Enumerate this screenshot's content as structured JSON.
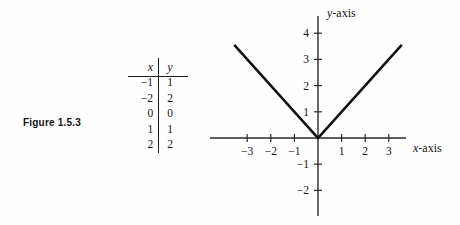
{
  "figure": {
    "caption": "Figure 1.5.3"
  },
  "table": {
    "headers": {
      "x": "x",
      "y": "y"
    },
    "rows": [
      {
        "x": "−1",
        "y": "1"
      },
      {
        "x": "−2",
        "y": "2"
      },
      {
        "x": "0",
        "y": "0"
      },
      {
        "x": "1",
        "y": "1"
      },
      {
        "x": "2",
        "y": "2"
      }
    ]
  },
  "chart_data": {
    "type": "line",
    "title": "",
    "xlabel": "x-axis",
    "ylabel": "y-axis",
    "xlabel_italic_prefix": "x",
    "xlabel_suffix": "-axis",
    "ylabel_italic_prefix": "y",
    "ylabel_suffix": "-axis",
    "xlim": [
      -3.8,
      3.75
    ],
    "ylim": [
      -2.95,
      4.4
    ],
    "xticks": [
      -3,
      -2,
      -1,
      1,
      2,
      3
    ],
    "xticklabels": [
      "−3",
      "−2",
      "−1",
      "1",
      "2",
      "3"
    ],
    "yticks": [
      4,
      3,
      2,
      1,
      -1,
      -2
    ],
    "yticklabels": [
      "4",
      "3",
      "2",
      "1",
      "−1",
      "−2"
    ],
    "grid": false,
    "legend": null,
    "series": [
      {
        "name": "y = |x|",
        "x": [
          -3.55,
          0,
          3.55
        ],
        "values": [
          3.55,
          0,
          3.55
        ]
      }
    ]
  },
  "colors": {
    "ink": "#141414",
    "axis": "#2a2a2a",
    "curve": "#111111",
    "background": "#fefefe"
  }
}
